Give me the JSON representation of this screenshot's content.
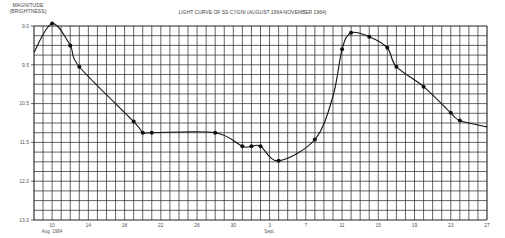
{
  "chart_data": {
    "type": "line",
    "title": "LIGHT CURVE OF SS CYGNI (AUGUST 1964-NOVEMBER 1964)",
    "ylabel_line1": "MAGNITUDE",
    "ylabel_line2": "(BRIGHTNESS)",
    "xlabel": "",
    "x_unit": "days since Aug 10, 1964",
    "y_inverted": true,
    "ylim": [
      9.0,
      13.0
    ],
    "xlim": [
      -2,
      48
    ],
    "grid": true,
    "y_tick_labels": [
      "9.0",
      "9.5",
      "10.5",
      "11.5",
      "12.0",
      "13.0"
    ],
    "x_ticks": [
      {
        "day": 0,
        "label": "10",
        "sub": "Aug. 1964"
      },
      {
        "day": 4,
        "label": "14",
        "sub": ""
      },
      {
        "day": 8,
        "label": "18",
        "sub": ""
      },
      {
        "day": 12,
        "label": "22",
        "sub": ""
      },
      {
        "day": 16,
        "label": "26",
        "sub": ""
      },
      {
        "day": 20,
        "label": "30",
        "sub": ""
      },
      {
        "day": 24,
        "label": "3",
        "sub": "Sept."
      },
      {
        "day": 28,
        "label": "7",
        "sub": ""
      },
      {
        "day": 32,
        "label": "11",
        "sub": ""
      },
      {
        "day": 36,
        "label": "15",
        "sub": ""
      },
      {
        "day": 40,
        "label": "19",
        "sub": ""
      },
      {
        "day": 44,
        "label": "23",
        "sub": ""
      },
      {
        "day": 48,
        "label": "27",
        "sub": ""
      }
    ],
    "series": [
      {
        "name": "SS Cygni",
        "points": [
          {
            "x": -2,
            "y": 9.54,
            "marker": false
          },
          {
            "x": 0,
            "y": 8.95,
            "marker": true
          },
          {
            "x": 2,
            "y": 9.4,
            "marker": true
          },
          {
            "x": 3,
            "y": 9.84,
            "marker": true
          },
          {
            "x": 9,
            "y": 10.97,
            "marker": true
          },
          {
            "x": 10,
            "y": 11.2,
            "marker": true
          },
          {
            "x": 11,
            "y": 11.2,
            "marker": true
          },
          {
            "x": 18,
            "y": 11.2,
            "marker": true
          },
          {
            "x": 21,
            "y": 11.48,
            "marker": true
          },
          {
            "x": 22,
            "y": 11.48,
            "marker": true
          },
          {
            "x": 23,
            "y": 11.48,
            "marker": true
          },
          {
            "x": 25,
            "y": 11.78,
            "marker": true
          },
          {
            "x": 29,
            "y": 11.34,
            "marker": true
          },
          {
            "x": 31,
            "y": 10.45,
            "marker": false
          },
          {
            "x": 32,
            "y": 9.48,
            "marker": true
          },
          {
            "x": 33,
            "y": 9.14,
            "marker": true
          },
          {
            "x": 35,
            "y": 9.22,
            "marker": true
          },
          {
            "x": 37,
            "y": 9.45,
            "marker": true
          },
          {
            "x": 38,
            "y": 9.84,
            "marker": true
          },
          {
            "x": 41,
            "y": 10.25,
            "marker": true
          },
          {
            "x": 44,
            "y": 10.79,
            "marker": true
          },
          {
            "x": 45,
            "y": 10.95,
            "marker": true
          },
          {
            "x": 48,
            "y": 11.08,
            "marker": false
          }
        ]
      }
    ]
  }
}
